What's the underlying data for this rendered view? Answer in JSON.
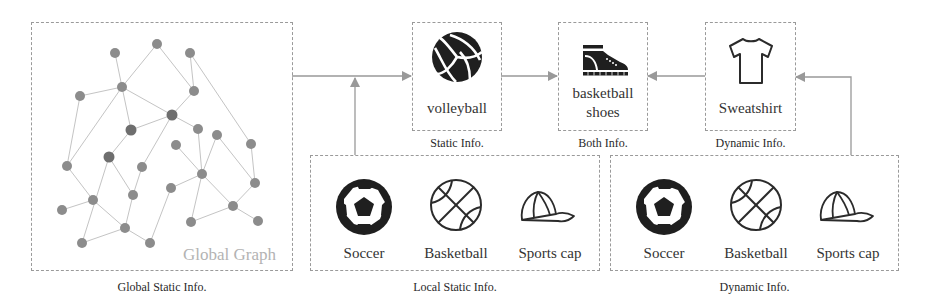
{
  "global": {
    "box_label": "Global Graph",
    "caption": "Global Static Info."
  },
  "top_boxes": [
    {
      "label": "volleyball",
      "caption": "Static Info.",
      "icon": "volleyball-icon"
    },
    {
      "label_line1": "basketball",
      "label_line2": "shoes",
      "caption": "Both Info.",
      "icon": "sneaker-icon"
    },
    {
      "label": "Sweatshirt",
      "caption": "Dynamic Info.",
      "icon": "tshirt-icon"
    }
  ],
  "local_static": {
    "caption": "Local Static Info.",
    "items": [
      {
        "label": "Soccer",
        "icon": "soccer-ball-icon"
      },
      {
        "label": "Basketball",
        "icon": "basketball-icon"
      },
      {
        "label": "Sports cap",
        "icon": "cap-icon"
      }
    ]
  },
  "dynamic": {
    "caption": "Dynamic Info.",
    "items": [
      {
        "label": "Soccer",
        "icon": "soccer-ball-icon"
      },
      {
        "label": "Basketball",
        "icon": "basketball-icon"
      },
      {
        "label": "Sports cap",
        "icon": "cap-icon"
      }
    ]
  },
  "colors": {
    "node": "#8c8c8c",
    "node_dark": "#6e6e6e",
    "edge": "#bdbdbd",
    "arrow": "#999999",
    "border": "#9a9a9a",
    "icon": "#2b2b2b"
  }
}
